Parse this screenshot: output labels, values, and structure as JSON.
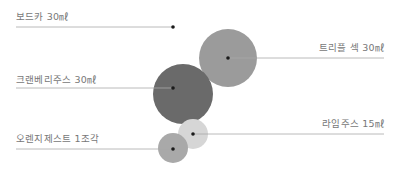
{
  "ingredients": [
    {
      "name": "보드카 30㎖",
      "side": "left",
      "color": "#ffffff",
      "cx": 173,
      "cy": 27,
      "r": 28,
      "label_x": 16,
      "label_y": 9,
      "line_x1": 16,
      "line_x2": 173,
      "line_y": 27
    },
    {
      "name": "트리플 섹 30㎖",
      "side": "right",
      "color": "#9b9b9b",
      "cx": 228,
      "cy": 58,
      "r": 29,
      "label_right": 8,
      "label_y": 40,
      "line_x1": 228,
      "line_x2": 384,
      "line_y": 58
    },
    {
      "name": "크랜베리주스 30㎖",
      "side": "left",
      "color": "#6a6a6a",
      "cx": 183,
      "cy": 94,
      "r": 30,
      "label_x": 16,
      "label_y": 72,
      "line_x1": 16,
      "line_x2": 173,
      "line_y": 88
    },
    {
      "name": "라임주스 15㎖",
      "side": "right",
      "color": "#d6d6d6",
      "cx": 193,
      "cy": 134,
      "r": 15,
      "label_right": 8,
      "label_y": 116,
      "line_x1": 193,
      "line_x2": 384,
      "line_y": 134
    },
    {
      "name": "오렌지제스트 1조각",
      "side": "left",
      "color": "#a9a9a9",
      "cx": 173,
      "cy": 148,
      "r": 15,
      "label_x": 16,
      "label_y": 131,
      "line_x1": 16,
      "line_x2": 173,
      "line_y": 149
    }
  ],
  "colors": {
    "line": "#a8a8a8",
    "dot": "#1a1a1a",
    "label": "#777777"
  }
}
